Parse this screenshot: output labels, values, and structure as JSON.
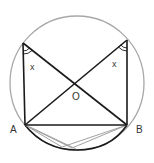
{
  "diagram": {
    "type": "circle-geometry",
    "labels": {
      "point_a": "A",
      "point_b": "B",
      "point_o": "O",
      "angle_left": "x",
      "angle_right": "x"
    },
    "colors": {
      "circle": "#a8a8a8",
      "lines": "#1a1a1a",
      "grey_lines": "#a0a0a0",
      "background": "#ffffff"
    },
    "points": {
      "top_left": [
        23,
        43
      ],
      "top_right": [
        127,
        40
      ],
      "A": [
        25,
        125
      ],
      "B": [
        127,
        125
      ],
      "O": [
        77,
        82
      ]
    },
    "circle": {
      "cx": 77,
      "cy": 83,
      "r": 67
    }
  }
}
